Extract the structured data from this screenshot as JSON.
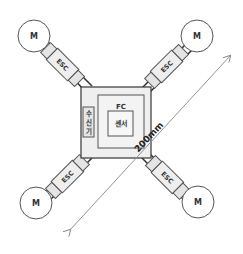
{
  "diagram": {
    "frame": {
      "fc_label": "FC",
      "sensor_label": "센서",
      "receiver_label": "수신기",
      "receiver_chars": [
        "수",
        "신",
        "기"
      ]
    },
    "arms": [
      {
        "position": "top-left",
        "motor_label": "M",
        "esc_label": "ESC"
      },
      {
        "position": "top-right",
        "motor_label": "M",
        "esc_label": "ESC"
      },
      {
        "position": "bottom-left",
        "motor_label": "M",
        "esc_label": "ESC"
      },
      {
        "position": "bottom-right",
        "motor_label": "M",
        "esc_label": "ESC"
      }
    ],
    "dimension": {
      "label": "200mm",
      "direction": "diagonal, bottom-left to top-right",
      "arrows": "both ends"
    },
    "colors": {
      "stroke": "#555555",
      "fill_light": "#eeeeee",
      "background": "#ffffff"
    }
  }
}
